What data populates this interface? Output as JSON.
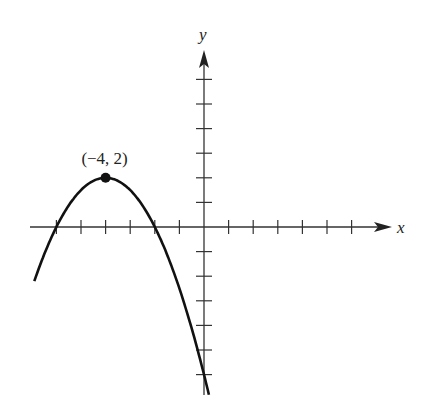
{
  "chart_data": {
    "type": "line",
    "title": "",
    "xlabel": "x",
    "ylabel": "y",
    "xlim": [
      -7,
      7.5
    ],
    "ylim": [
      -7,
      7
    ],
    "x_ticks": [
      -6,
      -5,
      -4,
      -3,
      -2,
      -1,
      1,
      2,
      3,
      4,
      5,
      6
    ],
    "y_ticks": [
      -6,
      -5,
      -4,
      -3,
      -2,
      -1,
      1,
      2,
      3,
      4,
      5,
      6
    ],
    "tick_labels_shown": false,
    "grid": false,
    "series": [
      {
        "name": "parabola",
        "equation": "y = -0.5(x + 4)^2 + 2",
        "x_range": [
          -6.9,
          0.2
        ],
        "points": [
          [
            -6.9,
            -2.2
          ],
          [
            -6,
            0
          ],
          [
            -5,
            1.5
          ],
          [
            -4,
            2
          ],
          [
            -3,
            1.5
          ],
          [
            -2,
            0
          ],
          [
            -1,
            -2.5
          ],
          [
            0,
            -6
          ],
          [
            0.2,
            -6.8
          ]
        ]
      }
    ],
    "annotations": [
      {
        "text": "(−4, 2)",
        "x": -4,
        "y": 2,
        "marker": "filled-dot"
      }
    ]
  }
}
